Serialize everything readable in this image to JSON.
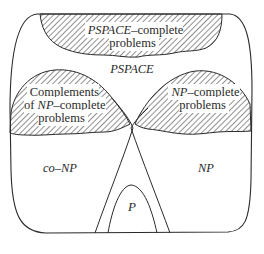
{
  "diagram": {
    "title": "",
    "colors": {
      "stroke": "#2a2a2a",
      "hatch": "#555555",
      "background": "#ffffff"
    },
    "regions": {
      "pspace": {
        "label": "PSPACE"
      },
      "pspace_complete": {
        "label_italic": "PSPACE",
        "label_rest": "–complete",
        "label_line2": "problems",
        "hatched": true
      },
      "co_np_complete": {
        "label_line1": "Complements",
        "label_prefix": "of ",
        "label_italic": "NP",
        "label_rest": "–complete",
        "label_line3": "problems",
        "hatched": true
      },
      "np_complete": {
        "label_italic": "NP",
        "label_rest": "–complete",
        "label_line2": "problems",
        "hatched": true
      },
      "co_np": {
        "label": "co–NP"
      },
      "np": {
        "label": "NP"
      },
      "p": {
        "label": "P"
      }
    }
  }
}
